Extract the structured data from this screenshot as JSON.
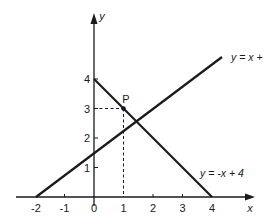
{
  "diagram": {
    "type": "coordinate-graph",
    "colors": {
      "ink": "#1a1a1a",
      "background": "#ffffff"
    },
    "axes": {
      "x_label": "x",
      "y_label": "y",
      "x_ticks": [
        "-2",
        "-1",
        "0",
        "1",
        "2",
        "3",
        "4"
      ],
      "y_ticks": [
        "1",
        "2",
        "3",
        "4"
      ]
    },
    "lines": [
      {
        "label": "y = x + 2",
        "from": [
          -2,
          0
        ],
        "to": [
          4.35,
          6.35
        ]
      },
      {
        "label": "y = -x + 4",
        "from": [
          0,
          4
        ],
        "to": [
          4,
          0
        ]
      }
    ],
    "point": {
      "label": "P",
      "x": 1,
      "y": 3
    }
  }
}
